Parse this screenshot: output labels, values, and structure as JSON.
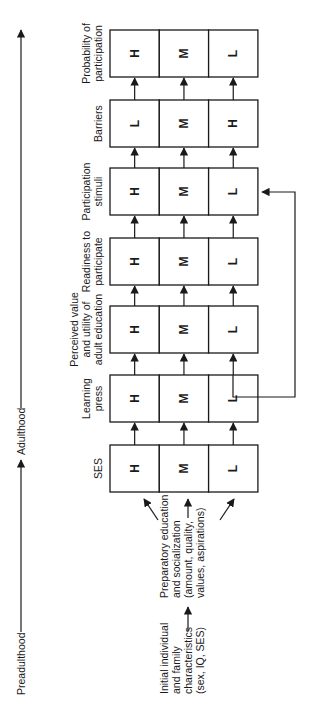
{
  "timeline": {
    "start_label": "Preadulthood",
    "mid_label": "Adulthood"
  },
  "inputs": {
    "initial": [
      "Initial individual",
      "and family",
      "characteristics",
      "(sex, IQ, SES)"
    ],
    "preparatory": [
      "Preparatory education",
      "and socialization",
      "(amount, quality,",
      "values, aspirations)"
    ]
  },
  "stages": [
    {
      "id": "ses",
      "title": [
        "SES"
      ],
      "cells": [
        "H",
        "M",
        "L"
      ]
    },
    {
      "id": "learning-press",
      "title": [
        "Learning",
        "press"
      ],
      "cells": [
        "H",
        "M",
        "L"
      ]
    },
    {
      "id": "perceived-value",
      "title": [
        "Perceived value",
        "and utility of",
        "adult education"
      ],
      "cells": [
        "H",
        "M",
        "L"
      ]
    },
    {
      "id": "readiness",
      "title": [
        "Readiness to",
        "participate"
      ],
      "cells": [
        "H",
        "M",
        "L"
      ]
    },
    {
      "id": "participation-stimuli",
      "title": [
        "Participation",
        "stimuli"
      ],
      "cells": [
        "H",
        "M",
        "L"
      ]
    },
    {
      "id": "barriers",
      "title": [
        "Barriers"
      ],
      "cells": [
        "L",
        "M",
        "H"
      ]
    },
    {
      "id": "probability",
      "title": [
        "Probability of",
        "participation"
      ],
      "cells": [
        "H",
        "M",
        "L"
      ]
    }
  ],
  "feedback": {
    "from": "learning-press",
    "to": "participation-stimuli",
    "row": "L"
  },
  "colors": {
    "line": "#1a1a1a",
    "background": "#ffffff"
  }
}
